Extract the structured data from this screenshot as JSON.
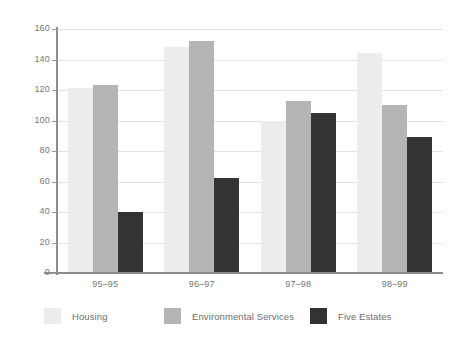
{
  "chart_data": {
    "type": "bar",
    "title": "",
    "subtitle": "",
    "xlabel": "",
    "ylabel": "",
    "categories": [
      "95–95",
      "96–97",
      "97–98",
      "98–99"
    ],
    "series": [
      {
        "name": "Housing",
        "color": "#ededed",
        "values": [
          121,
          148,
          100,
          144
        ]
      },
      {
        "name": "Environmental Services",
        "color": "#b5b5b5",
        "values": [
          123,
          152,
          113,
          110
        ]
      },
      {
        "name": "Five Estates",
        "color": "#333333",
        "values": [
          40,
          62,
          105,
          89
        ]
      }
    ],
    "ylim": [
      0,
      160
    ],
    "ytick_step": 20,
    "yticks": [
      0,
      20,
      40,
      60,
      80,
      100,
      120,
      140,
      160
    ],
    "ytick_labels": [
      "0",
      "20",
      "40",
      "60",
      "80",
      "100",
      "120",
      "140",
      "160"
    ],
    "grid": true,
    "grid_axis": "y",
    "grid_color": "#e2e2e2",
    "axis_color": "#8c8c8c",
    "legend": true,
    "legend_position": "bottom",
    "background": "#ffffff",
    "bar_group_gap": true
  },
  "legend": {
    "items": [
      {
        "label": "Housing",
        "color": "#ededed"
      },
      {
        "label": "Environmental Services",
        "color": "#b5b5b5"
      },
      {
        "label": "Five Estates",
        "color": "#333333"
      }
    ]
  }
}
